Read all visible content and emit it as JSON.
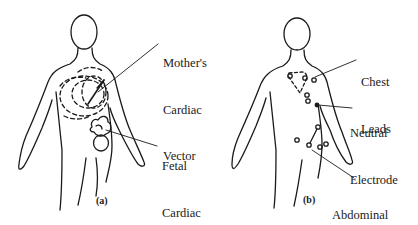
{
  "figure": {
    "panels": [
      {
        "id": "a",
        "tag": "(a)",
        "labels": {
          "mother": [
            "Mother's",
            "Cardiac",
            "Vector"
          ],
          "fetal": [
            "Fetal",
            "Cardiac",
            "Vector"
          ]
        }
      },
      {
        "id": "b",
        "tag": "(b)",
        "labels": {
          "chest": [
            "Chest",
            "Leads"
          ],
          "neutral": [
            "Neutral",
            "Electrode"
          ],
          "abdominal": [
            "Abdominal",
            "Lead",
            "Placements"
          ]
        }
      }
    ],
    "colors": {
      "ink": "#1a1a1a",
      "background": "#ffffff"
    }
  }
}
